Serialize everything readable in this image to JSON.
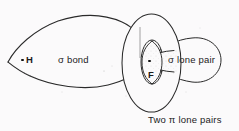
{
  "figure": {
    "background_color": "#fbfafb",
    "ink_color": "#1b1b1b"
  },
  "labels": {
    "hydrogen_atom": "H",
    "sigma_bond": "σ bond",
    "fluorine_atom": "F",
    "sigma_lone_pair": "σ lone pair",
    "pi_lone_pairs": "Two π lone pairs"
  },
  "shapes": [
    {
      "name": "sigma-bond-lobe",
      "kind": "teardrop",
      "orientation": "points-left"
    },
    {
      "name": "pi-lone-pair-torus",
      "kind": "torus",
      "orientation": "vertical-ring"
    },
    {
      "name": "sigma-lone-pair-lobe",
      "kind": "lobe",
      "orientation": "points-right"
    },
    {
      "name": "fluorine-core-lobe",
      "kind": "small-lens",
      "orientation": "vertical"
    }
  ],
  "atoms": [
    {
      "name": "hydrogen",
      "symbol": "H"
    },
    {
      "name": "fluorine",
      "symbol": "F"
    }
  ]
}
